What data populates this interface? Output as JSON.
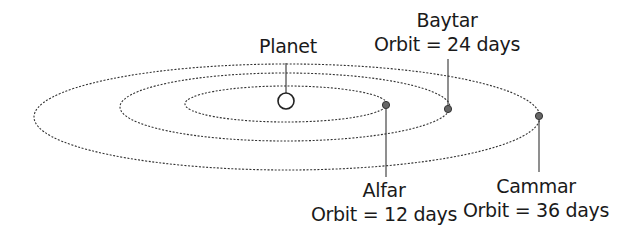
{
  "diagram": {
    "planet": {
      "label": "Planet",
      "cx": 286,
      "cy": 101,
      "r": 8
    },
    "orbits": [
      {
        "name": "inner",
        "cx": 286,
        "cy": 104,
        "rx": 101,
        "ry": 18
      },
      {
        "name": "middle",
        "cx": 285,
        "cy": 107,
        "rx": 165,
        "ry": 34
      },
      {
        "name": "outer",
        "cx": 287,
        "cy": 117,
        "rx": 253,
        "ry": 53
      }
    ],
    "moons": [
      {
        "name": "Alfar",
        "orbit_text": "Orbit = 12 days",
        "period_days": 12,
        "x": 386,
        "y": 105
      },
      {
        "name": "Baytar",
        "orbit_text": "Orbit = 24 days",
        "period_days": 24,
        "x": 448,
        "y": 109
      },
      {
        "name": "Cammar",
        "orbit_text": "Orbit = 36 days",
        "period_days": 36,
        "x": 539,
        "y": 116
      }
    ],
    "colors": {
      "line": "#333333",
      "moon_fill": "#666666",
      "background": "#ffffff"
    }
  }
}
